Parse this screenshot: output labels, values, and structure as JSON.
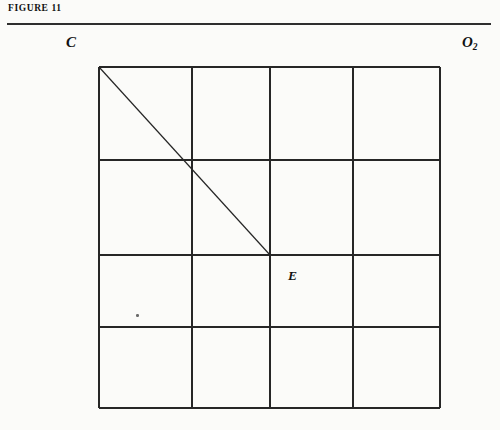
{
  "figure": {
    "caption_label": "FIGURE 11",
    "rule_color": "#2e2e2e"
  },
  "labels": {
    "top_left": "C",
    "top_right_base": "O",
    "top_right_sub": "2",
    "interior_point": "E"
  },
  "diagram": {
    "type": "geometric-grid",
    "line_color": "#262626",
    "background_color": "#fbfbf9",
    "grid": {
      "columns": 4,
      "rows": 4,
      "x_lines": [
        99,
        192,
        270,
        353,
        440
      ],
      "y_lines": [
        67,
        160,
        255,
        327,
        408
      ],
      "border_width": 2,
      "inner_width": 1.4
    },
    "diagonal": {
      "from_label": "C",
      "to_label": "E",
      "x1": 99,
      "y1": 67,
      "x2": 270,
      "y2": 255,
      "width": 1.2
    },
    "speck": {
      "x": 136,
      "y": 314
    }
  }
}
